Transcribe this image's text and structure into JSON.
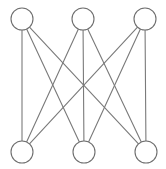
{
  "figure": {
    "background_color": "#ffffff",
    "width": 166,
    "height": 169
  },
  "style": {
    "edge_color": "#7a7a7a",
    "edge_width": 1.1,
    "node_stroke_color": "#6e6e6e",
    "node_fill_color": "#ffffff",
    "node_stroke_width": 1.1,
    "node_radius": 11
  },
  "chart_data": {
    "type": "diagram",
    "diagram_kind": "graph",
    "graph_name": "K3,3",
    "bipartite": true,
    "node_count": 6,
    "edge_count": 9,
    "nodes": [
      {
        "id": "u1",
        "label": "",
        "set": "top",
        "x": 22,
        "y": 19
      },
      {
        "id": "u2",
        "label": "",
        "set": "top",
        "x": 83,
        "y": 19
      },
      {
        "id": "u3",
        "label": "",
        "set": "top",
        "x": 145,
        "y": 19
      },
      {
        "id": "v1",
        "label": "",
        "set": "bottom",
        "x": 22,
        "y": 152
      },
      {
        "id": "v2",
        "label": "",
        "set": "bottom",
        "x": 84,
        "y": 152
      },
      {
        "id": "v3",
        "label": "",
        "set": "bottom",
        "x": 146,
        "y": 152
      }
    ],
    "edges": [
      {
        "from": "u1",
        "to": "v1"
      },
      {
        "from": "u1",
        "to": "v2"
      },
      {
        "from": "u1",
        "to": "v3"
      },
      {
        "from": "u2",
        "to": "v1"
      },
      {
        "from": "u2",
        "to": "v2"
      },
      {
        "from": "u2",
        "to": "v3"
      },
      {
        "from": "u3",
        "to": "v1"
      },
      {
        "from": "u3",
        "to": "v2"
      },
      {
        "from": "u3",
        "to": "v3"
      }
    ]
  }
}
